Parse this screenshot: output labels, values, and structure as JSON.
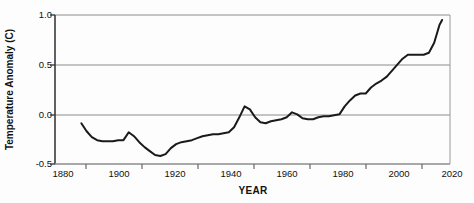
{
  "chart_data": {
    "type": "line",
    "title": "",
    "xlabel": "YEAR",
    "ylabel": "Temperature Anomaly (C)",
    "xlim": [
      1870,
      2020
    ],
    "ylim": [
      -0.5,
      1.0
    ],
    "xticks": [
      1880,
      1900,
      1920,
      1940,
      1960,
      1980,
      2000,
      2020
    ],
    "xtick_labels": [
      "1880",
      "1900",
      "1920",
      "1940",
      "1960",
      "1980",
      "2000",
      "2020"
    ],
    "yticks": [
      -0.5,
      0.0,
      0.5,
      1.0
    ],
    "ytick_labels": [
      "-0.5",
      "0.0",
      "0.5",
      "1.0"
    ],
    "grid": "horizontal",
    "legend": "none",
    "line_color": "#1a1a1a",
    "line_width": 2.0,
    "series": [
      {
        "name": "Global Temperature Anomaly",
        "x": [
          1880,
          1882,
          1884,
          1886,
          1888,
          1890,
          1892,
          1894,
          1896,
          1898,
          1900,
          1902,
          1904,
          1906,
          1908,
          1910,
          1912,
          1914,
          1916,
          1918,
          1920,
          1922,
          1924,
          1926,
          1928,
          1930,
          1932,
          1934,
          1936,
          1938,
          1940,
          1942,
          1944,
          1946,
          1948,
          1950,
          1952,
          1954,
          1956,
          1958,
          1960,
          1962,
          1964,
          1966,
          1968,
          1970,
          1972,
          1974,
          1976,
          1978,
          1980,
          1982,
          1984,
          1986,
          1988,
          1990,
          1992,
          1994,
          1996,
          1998,
          2000,
          2002,
          2004,
          2006,
          2008,
          2010,
          2012,
          2014,
          2016,
          2017
        ],
        "y": [
          -0.09,
          -0.17,
          -0.23,
          -0.26,
          -0.27,
          -0.27,
          -0.27,
          -0.26,
          -0.26,
          -0.18,
          -0.22,
          -0.28,
          -0.33,
          -0.37,
          -0.41,
          -0.42,
          -0.4,
          -0.34,
          -0.3,
          -0.28,
          -0.27,
          -0.26,
          -0.24,
          -0.22,
          -0.21,
          -0.2,
          -0.2,
          -0.19,
          -0.18,
          -0.13,
          -0.03,
          0.08,
          0.05,
          -0.03,
          -0.08,
          -0.09,
          -0.07,
          -0.06,
          -0.05,
          -0.03,
          0.02,
          0.0,
          -0.04,
          -0.05,
          -0.05,
          -0.03,
          -0.02,
          -0.02,
          -0.01,
          0.0,
          0.08,
          0.14,
          0.19,
          0.21,
          0.21,
          0.27,
          0.31,
          0.34,
          0.38,
          0.44,
          0.5,
          0.56,
          0.6,
          0.6,
          0.6,
          0.6,
          0.62,
          0.72,
          0.9,
          0.95
        ]
      }
    ]
  },
  "axes": {
    "y_title": "Temperature Anomaly (C)",
    "x_title": "YEAR",
    "y_labels": [
      "1.0",
      "0.5",
      "0.0",
      "-0.5"
    ],
    "x_labels": [
      "1880",
      "1900",
      "1920",
      "1940",
      "1960",
      "1980",
      "2000",
      "2020"
    ]
  }
}
